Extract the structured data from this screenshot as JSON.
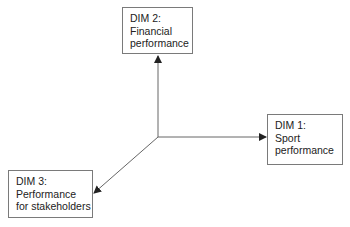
{
  "diagram": {
    "type": "three-axis dimension diagram",
    "origin": {
      "x": 158,
      "y": 137
    },
    "line_color": "#555555",
    "dimensions": [
      {
        "id": "dim1",
        "label": "DIM 1:",
        "lines": [
          "Sport",
          "performance"
        ],
        "direction": "right"
      },
      {
        "id": "dim2",
        "label": "DIM 2:",
        "lines": [
          "Financial",
          "performance"
        ],
        "direction": "up"
      },
      {
        "id": "dim3",
        "label": "DIM 3:",
        "lines": [
          "Performance",
          "for stakeholders"
        ],
        "direction": "down-left"
      }
    ]
  }
}
